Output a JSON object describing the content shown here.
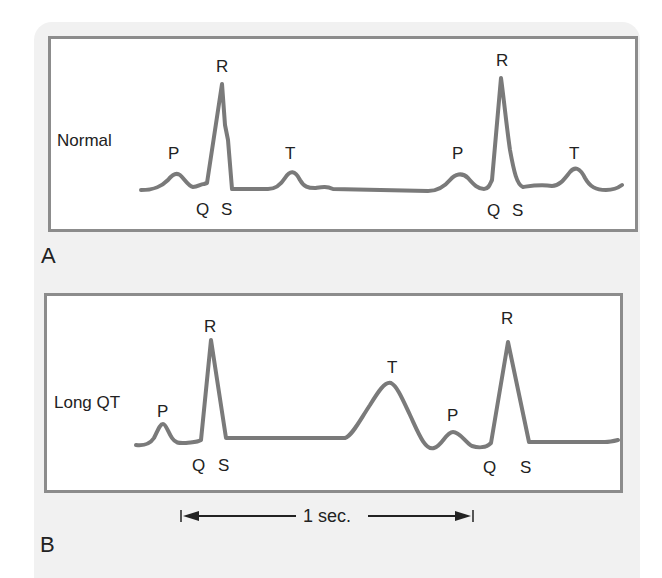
{
  "figure": {
    "panels": [
      {
        "id": "A",
        "letter": "A",
        "rhythm_label": "Normal",
        "wave_labels": {
          "p1": "P",
          "r1": "R",
          "q1": "Q",
          "s1": "S",
          "t1": "T",
          "p2": "P",
          "r2": "R",
          "q2": "Q",
          "s2": "S",
          "t2": "T"
        }
      },
      {
        "id": "B",
        "letter": "B",
        "rhythm_label": "Long QT",
        "wave_labels": {
          "p1": "P",
          "r1": "R",
          "q1": "Q",
          "s1": "S",
          "t1": "T",
          "p2": "P",
          "r2": "R",
          "q2": "Q",
          "s2": "S"
        }
      }
    ],
    "scale_bar": {
      "label": "1 sec."
    },
    "colors": {
      "trace": "#7a7a7a",
      "frame": "#8c8c8c",
      "background": "#f1f1f1",
      "text": "#222222"
    }
  }
}
